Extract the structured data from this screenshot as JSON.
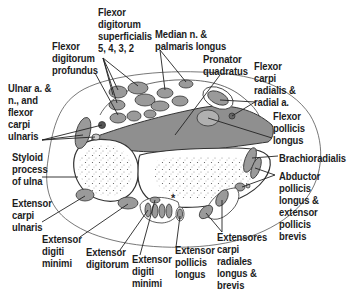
{
  "diagram": {
    "type": "anatomical cross-section",
    "colors": {
      "outline": "#3a3a3a",
      "muscle_fill": "#9a9a9a",
      "muscle_fill_light": "#b5b5b5",
      "bone_fill": "#ffffff",
      "label_text": "#1c1c1c",
      "background": "#ffffff"
    },
    "marker": "*",
    "labels": [
      {
        "id": "fds",
        "text": "Flexor\ndigitorum\nsuperficialis\n5, 4, 3, 2"
      },
      {
        "id": "median",
        "text": "Median n. &\npalmaris longus"
      },
      {
        "id": "fdp",
        "text": "Flexor\ndigitorum\nprofundus"
      },
      {
        "id": "pronator",
        "text": "Pronator\nquadratus"
      },
      {
        "id": "ulnar",
        "text": "Ulnar a. &\nn., and\nflexor\ncarpi\nulnaris"
      },
      {
        "id": "fcr",
        "text": "Flexor\ncarpi\nradialis &\nradial a."
      },
      {
        "id": "fpl",
        "text": "Flexor\npollicis\nlongus"
      },
      {
        "id": "styloid",
        "text": "Styloid\nprocess\nof ulna"
      },
      {
        "id": "brachio",
        "text": "Brachioradialis"
      },
      {
        "id": "abductor",
        "text": "Abductor\npollicis\nlongus &\nextensor\npollicis\nbrevis"
      },
      {
        "id": "ecu",
        "text": "Extensor\ncarpi\nulnaris"
      },
      {
        "id": "edm1",
        "text": "Extensor\ndigiti\nminimi"
      },
      {
        "id": "ed",
        "text": "Extensor\ndigitorum"
      },
      {
        "id": "edm2",
        "text": "Extensor\ndigiti\nminimi"
      },
      {
        "id": "epl",
        "text": "Extensor\npollicis\nlongus"
      },
      {
        "id": "ecr",
        "text": "Extensores\ncarpi\nradiales\nlongus &\nbrevis"
      }
    ]
  }
}
